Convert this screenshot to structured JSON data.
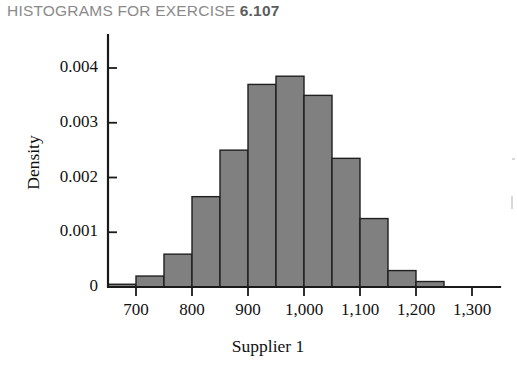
{
  "title": {
    "prefix": "HISTOGRAMS FOR EXERCISE ",
    "number": "6.107"
  },
  "colors": {
    "bar_fill": "#808080",
    "bar_stroke": "#1f1f1f",
    "axis": "#1a1a1a",
    "title_text": "#8a8a8a",
    "title_number": "#5d5d5d"
  },
  "chart_data": {
    "type": "bar",
    "title": "HISTOGRAMS FOR EXERCISE 6.107",
    "xlabel": "Supplier 1",
    "ylabel": "Density",
    "grid": false,
    "legend": null,
    "bin_width": 50,
    "xlim": [
      650,
      1350
    ],
    "ylim": [
      0,
      0.0043
    ],
    "xticks": [
      700,
      800,
      900,
      1000,
      1100,
      1200,
      1300
    ],
    "xticklabels": [
      "700",
      "800",
      "900",
      "1,000",
      "1,100",
      "1,200",
      "1,300"
    ],
    "yticks": [
      0,
      0.001,
      0.002,
      0.003,
      0.004
    ],
    "yticklabels": [
      "0",
      "0.001",
      "0.002",
      "0.003",
      "0.004"
    ],
    "bin_edges": [
      650,
      700,
      750,
      800,
      850,
      900,
      950,
      1000,
      1050,
      1100,
      1150,
      1200,
      1250,
      1300
    ],
    "values": [
      5e-05,
      0.0002,
      0.0006,
      0.00165,
      0.0025,
      0.0037,
      0.00385,
      0.0035,
      0.00235,
      0.00125,
      0.0003,
      0.0001,
      0.0
    ]
  }
}
